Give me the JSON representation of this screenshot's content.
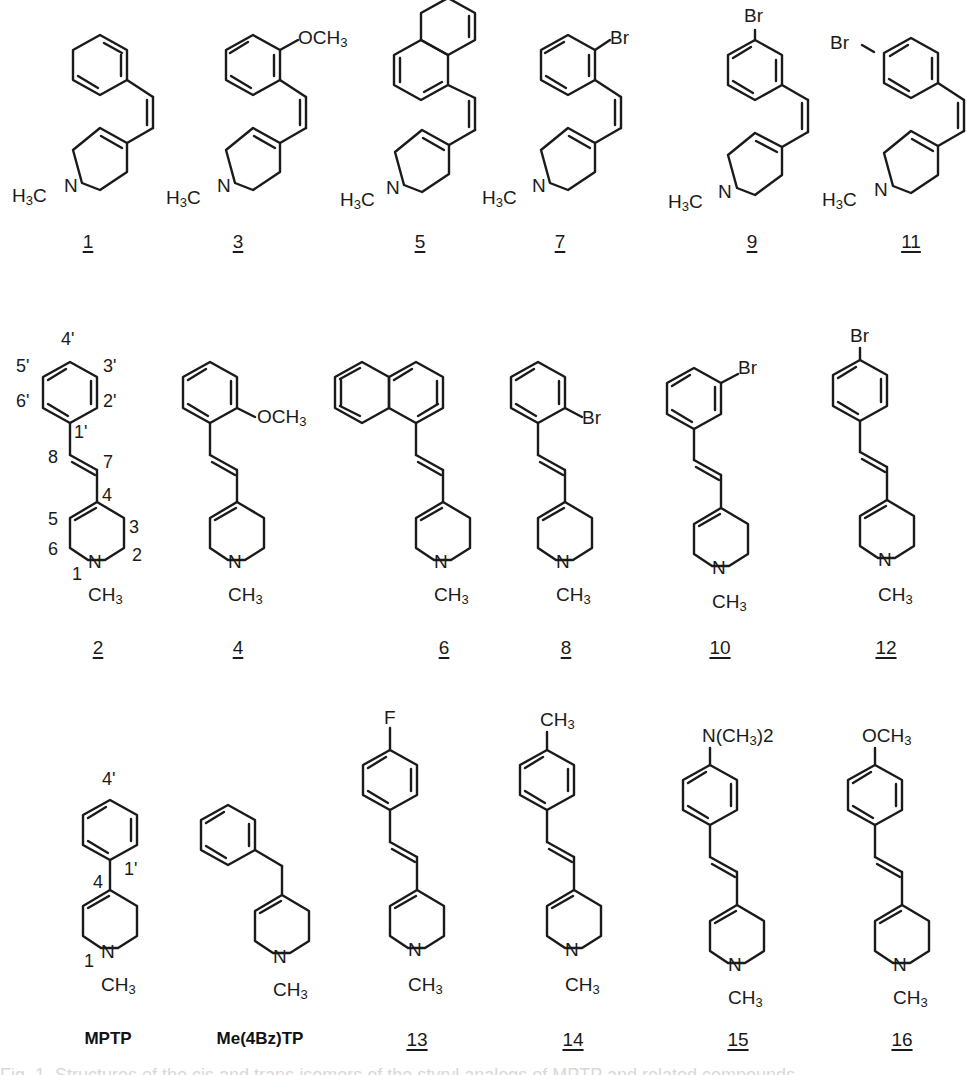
{
  "figure": {
    "rows": [
      {
        "row": "cis-isomers",
        "compounds": [
          {
            "id": "1",
            "label": "1",
            "substituent": "H",
            "amine_label": "H3C",
            "n_label": "N"
          },
          {
            "id": "3",
            "label": "3",
            "substituent": "OCH3",
            "position": "2'",
            "amine_label": "H3C",
            "n_label": "N"
          },
          {
            "id": "5",
            "label": "5",
            "substituent": "1-naphthyl",
            "amine_label": "H3C",
            "n_label": "N"
          },
          {
            "id": "7",
            "label": "7",
            "substituent": "Br",
            "position": "2'",
            "amine_label": "H3C",
            "n_label": "N"
          },
          {
            "id": "9",
            "label": "9",
            "substituent": "Br",
            "position": "3'",
            "amine_label": "H3C",
            "n_label": "N"
          },
          {
            "id": "11",
            "label": "11",
            "substituent": "Br",
            "position": "4'",
            "amine_label": "H3C",
            "n_label": "N"
          }
        ]
      },
      {
        "row": "trans-isomers",
        "compounds": [
          {
            "id": "2",
            "label": "2",
            "substituent": "H",
            "n_label": "N",
            "methyl_label": "CH3",
            "atom_numbers": [
              "4'",
              "5'",
              "3'",
              "6'",
              "2'",
              "1'",
              "8",
              "7",
              "4",
              "5",
              "3",
              "6",
              "2",
              "1"
            ]
          },
          {
            "id": "4",
            "label": "4",
            "substituent": "OCH3",
            "position": "2'",
            "n_label": "N",
            "methyl_label": "CH3"
          },
          {
            "id": "6",
            "label": "6",
            "substituent": "1-naphthyl",
            "n_label": "N",
            "methyl_label": "CH3"
          },
          {
            "id": "8",
            "label": "8",
            "substituent": "Br",
            "position": "2'",
            "n_label": "N",
            "methyl_label": "CH3"
          },
          {
            "id": "10",
            "label": "10",
            "substituent": "Br",
            "position": "3'",
            "n_label": "N",
            "methyl_label": "CH3"
          },
          {
            "id": "12",
            "label": "12",
            "substituent": "Br",
            "position": "4'",
            "n_label": "N",
            "methyl_label": "CH3"
          }
        ]
      },
      {
        "row": "reference-and-para",
        "compounds": [
          {
            "id": "MPTP",
            "label": "MPTP",
            "n_label": "N",
            "methyl_label": "CH3",
            "atom_numbers": [
              "4'",
              "1'",
              "4",
              "1"
            ]
          },
          {
            "id": "Me(4Bz)TP",
            "label": "Me(4Bz)TP",
            "n_label": "N",
            "methyl_label": "CH3"
          },
          {
            "id": "13",
            "label": "13",
            "substituent": "F",
            "position": "4'",
            "n_label": "N",
            "methyl_label": "CH3"
          },
          {
            "id": "14",
            "label": "14",
            "substituent": "CH3",
            "position": "4'",
            "n_label": "N",
            "methyl_label": "CH3"
          },
          {
            "id": "15",
            "label": "15",
            "substituent": "N(CH3)2",
            "position": "4'",
            "n_label": "N",
            "methyl_label": "CH3"
          },
          {
            "id": "16",
            "label": "16",
            "substituent": "OCH3",
            "position": "4'",
            "n_label": "N",
            "methyl_label": "CH3"
          }
        ]
      }
    ],
    "text": {
      "H3C": "H",
      "C": "C",
      "N": "N",
      "CH": "CH",
      "three": "3",
      "two": "2",
      "OCH": "OCH",
      "Br": "Br",
      "F": "F",
      "NCH": "N(CH",
      "close2": ")2",
      "caption_fragment": "Fig. 1. Structures of the cis and trans isomers of the styryl analogs of MPTP and related compounds."
    }
  }
}
